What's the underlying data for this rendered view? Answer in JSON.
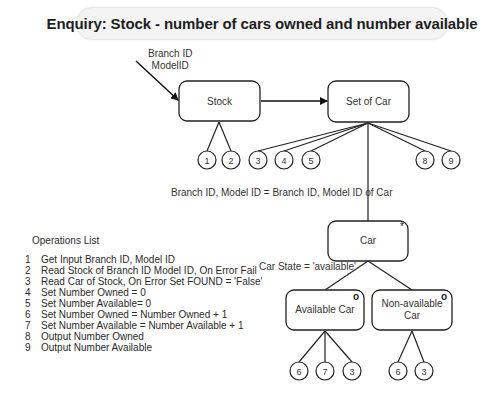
{
  "title": "Enquiry: Stock - number of cars owned and number available",
  "input_label": {
    "line1": "Branch ID",
    "line2": "ModelID"
  },
  "nodes": {
    "stock": {
      "label": "Stock"
    },
    "set_of_car": {
      "label": "Set of Car"
    },
    "car": {
      "label": "Car",
      "marker": "*"
    },
    "available_car": {
      "label": "Available Car",
      "marker": "o"
    },
    "non_available_car": {
      "label_line1": "Non-available",
      "label_line2": "Car",
      "marker": "o"
    }
  },
  "conditions": {
    "set_to_car": "Branch ID, Model ID = Branch ID, Model ID of Car",
    "car_state": "Car State = 'available'"
  },
  "operation_circles": {
    "stock": [
      "1",
      "2"
    ],
    "set_of_car_left": [
      "3",
      "4",
      "5"
    ],
    "set_of_car_right": [
      "8",
      "9"
    ],
    "available_car": [
      "6",
      "7",
      "3"
    ],
    "non_available_car": [
      "6",
      "3"
    ]
  },
  "operations_list": {
    "title": "Operations List",
    "items": [
      {
        "num": "1",
        "text": "Get Input Branch ID, Model ID"
      },
      {
        "num": "2",
        "text": "Read Stock of Branch ID Model ID, On Error Fail"
      },
      {
        "num": "3",
        "text": "Read Car of Stock, On Error Set FOUND = 'False'"
      },
      {
        "num": "4",
        "text": "Set Number Owned = 0"
      },
      {
        "num": "5",
        "text": "Set Number Available= 0"
      },
      {
        "num": "6",
        "text": "Set Number Owned = Number Owned + 1"
      },
      {
        "num": "7",
        "text": "Set Number Available = Number Available + 1"
      },
      {
        "num": "8",
        "text": "Output Number Owned"
      },
      {
        "num": "9",
        "text": "Output Number Available"
      }
    ]
  }
}
